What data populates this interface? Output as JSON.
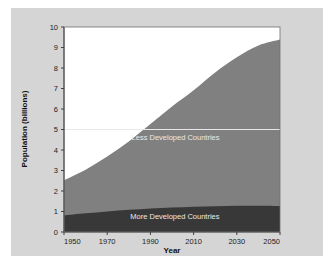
{
  "chart_data": {
    "type": "area",
    "stacked": true,
    "title": "",
    "subtitle": "",
    "xlabel": "Year",
    "ylabel": "Population (billions)",
    "xlim": [
      1950,
      2050
    ],
    "ylim": [
      0,
      10
    ],
    "xticks": [
      1950,
      1970,
      1990,
      2010,
      2030,
      2050
    ],
    "yticks": [
      0,
      1,
      2,
      3,
      4,
      5,
      6,
      7,
      8,
      9,
      10
    ],
    "grid": "single faint horizontal line at y=5",
    "legend_position": "inline annotations inside areas",
    "x": [
      1950,
      1960,
      1970,
      1980,
      1990,
      2000,
      2010,
      2020,
      2030,
      2040,
      2050
    ],
    "series": [
      {
        "name": "More Developed Countries",
        "color": "#383838",
        "label_color": "#e9e9e9",
        "values": [
          0.81,
          0.91,
          1.0,
          1.08,
          1.15,
          1.19,
          1.23,
          1.26,
          1.28,
          1.28,
          1.27
        ]
      },
      {
        "name": "Less Developed Countries",
        "color": "#808080",
        "label_color": "#e9e9e9",
        "values": [
          1.72,
          2.13,
          2.68,
          3.34,
          4.12,
          4.93,
          5.68,
          6.52,
          7.24,
          7.82,
          8.12
        ]
      }
    ],
    "totals": [
      2.53,
      3.04,
      3.68,
      4.42,
      5.27,
      6.12,
      6.91,
      7.78,
      8.52,
      9.1,
      9.39
    ],
    "annotations": [
      {
        "text": "Less Developed Countries",
        "x": 2022,
        "y": 4.5
      },
      {
        "text": "More Developed Countries",
        "x": 2022,
        "y": 0.62
      }
    ],
    "colors": {
      "figure_background": "#d5d5d5",
      "plot_background": "#ffffff",
      "axis": "#404040",
      "gridline": "#e8e8e8",
      "more_developed": "#383838",
      "less_developed": "#808080",
      "text": "#1c1c1c"
    }
  },
  "axis": {
    "y_title": "Population (billions)",
    "x_title": "Year",
    "y_tick_labels": [
      "0",
      "1",
      "2",
      "3",
      "4",
      "5",
      "6",
      "7",
      "8",
      "9",
      "10"
    ],
    "x_tick_labels": [
      "1950",
      "1970",
      "1990",
      "2010",
      "2030",
      "2050"
    ]
  },
  "labels": {
    "less_developed": "Less Developed Countries",
    "more_developed": "More Developed Countries"
  }
}
